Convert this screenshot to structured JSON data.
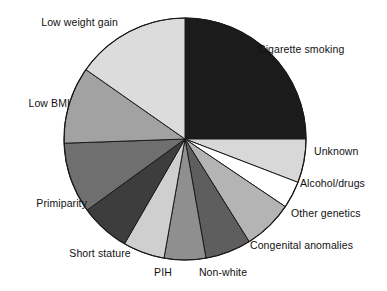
{
  "chart_data": {
    "type": "pie",
    "title": "",
    "subtitle": "",
    "xlabel": "",
    "ylabel": "",
    "legend_position": "none",
    "grid": false,
    "labels_placement": "outside-callout",
    "center": {
      "x": 185,
      "y": 139
    },
    "radius": 121,
    "start_angle_deg": 0,
    "direction": "clockwise",
    "categories": [
      "Cigarette smoking",
      "Unknown",
      "Alcohol/drugs",
      "Other genetics",
      "Congenital anomalies",
      "Non-white",
      "PIH",
      "Short stature",
      "Primiparity",
      "Low BMI",
      "Low weight gain"
    ],
    "values": [
      25.0,
      5.8,
      3.6,
      6.7,
      6.1,
      5.6,
      5.6,
      6.7,
      9.4,
      10.3,
      15.2
    ],
    "slices": [
      {
        "label": "Cigarette smoking",
        "value": 25.0,
        "start_deg": 0.0,
        "end_deg": 90.0,
        "color": "#1b1b1b"
      },
      {
        "label": "Unknown",
        "value": 5.8,
        "start_deg": 90.0,
        "end_deg": 111.0,
        "color": "#d8d8d8"
      },
      {
        "label": "Alcohol/drugs",
        "value": 3.6,
        "start_deg": 111.0,
        "end_deg": 124.0,
        "color": "#ffffff"
      },
      {
        "label": "Other genetics",
        "value": 6.7,
        "start_deg": 124.0,
        "end_deg": 148.0,
        "color": "#b4b4b4"
      },
      {
        "label": "Congenital anomalies",
        "value": 6.1,
        "start_deg": 148.0,
        "end_deg": 170.0,
        "color": "#5e5e5e"
      },
      {
        "label": "Non-white",
        "value": 5.6,
        "start_deg": 170.0,
        "end_deg": 190.0,
        "color": "#8f8f8f"
      },
      {
        "label": "PIH",
        "value": 5.6,
        "start_deg": 190.0,
        "end_deg": 210.0,
        "color": "#cfcfcf"
      },
      {
        "label": "Short stature",
        "value": 6.7,
        "start_deg": 210.0,
        "end_deg": 234.0,
        "color": "#3d3d3d"
      },
      {
        "label": "Primiparity",
        "value": 9.4,
        "start_deg": 234.0,
        "end_deg": 268.0,
        "color": "#6f6f6f"
      },
      {
        "label": "Low BMI",
        "value": 10.3,
        "start_deg": 268.0,
        "end_deg": 305.0,
        "color": "#a2a2a2"
      },
      {
        "label": "Low weight gain",
        "value": 15.2,
        "start_deg": 305.0,
        "end_deg": 360.0,
        "color": "#dcdcdc"
      }
    ]
  },
  "labels": {
    "low_weight_gain": "Low weight gain",
    "cigarette_smoking": "Cigarette smoking",
    "low_bmi": "Low BMI",
    "unknown": "Unknown",
    "alcohol_drugs": "Alcohol/drugs",
    "other_genetics": "Other genetics",
    "primiparity": "Primiparity",
    "congenital_anomalies": "Congenital anomalies",
    "short_stature": "Short stature",
    "pih": "PIH",
    "non_white": "Non-white"
  },
  "style": {
    "background": "#ffffff",
    "text_color": "#111111",
    "slice_outline": "#1a1a1a"
  }
}
